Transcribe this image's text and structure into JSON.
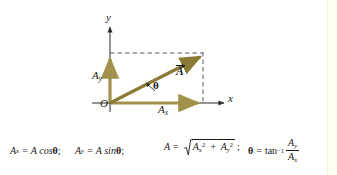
{
  "figure": {
    "axes": {
      "x_label": "x",
      "y_label": "y",
      "origin_label": "O"
    },
    "vectors": [
      {
        "name": "resultant",
        "label": "A",
        "label_style": "italic bold with arrow overbar",
        "color": "#8a7a35",
        "from": [
          110,
          103
        ],
        "to": [
          203,
          55
        ]
      },
      {
        "name": "x-component",
        "label": "A",
        "subscript": "x",
        "color": "#a1914a",
        "from": [
          110,
          103
        ],
        "to": [
          200,
          103
        ]
      },
      {
        "name": "y-component",
        "label": "A",
        "subscript": "y",
        "color": "#a1914a",
        "from": [
          110,
          103
        ],
        "to": [
          110,
          56
        ]
      }
    ],
    "angle": {
      "label": "θ",
      "symbol": "theta"
    },
    "labels": {
      "y_axis": "y",
      "x_axis": "x",
      "origin": "O",
      "Ay_base": "A",
      "Ay_sub": "y",
      "Ax_base": "A",
      "Ax_sub": "x",
      "A_vector": "A",
      "theta": "θ"
    },
    "dashed_lines": [
      {
        "name": "horizontal-projection",
        "from": [
          110,
          53
        ],
        "to": [
          203,
          53
        ]
      },
      {
        "name": "vertical-projection",
        "from": [
          203,
          53
        ],
        "to": [
          203,
          103
        ]
      }
    ],
    "colors": {
      "vector_dark": "#8a7a35",
      "vector_light": "#a1914a",
      "axis": "#2b2b2b",
      "dashed": "#3a4a6b",
      "background": "#fffffd",
      "right_strip": "#fffef2"
    }
  },
  "formulas": {
    "eq1": {
      "lhs_base": "A",
      "lhs_sub": "x",
      "equals": "=",
      "rhs": "A cos",
      "theta": "θ",
      "terminator": ";"
    },
    "eq2": {
      "lhs_base": "A",
      "lhs_sub": "y",
      "equals": "=",
      "rhs": "A sin",
      "theta": "θ",
      "terminator": ";"
    },
    "eq3": {
      "lhs": "A",
      "equals": "=",
      "radicand_1_base": "A",
      "radicand_1_sub": "x",
      "radicand_1_sup": "2",
      "plus": "+",
      "radicand_2_base": "A",
      "radicand_2_sub": "y",
      "radicand_2_sup": "2",
      "terminator": ";"
    },
    "eq4": {
      "lhs": "θ",
      "equals": "=",
      "fn": "tan",
      "fn_sup": "−1",
      "num_base": "A",
      "num_sub": "y",
      "den_base": "A",
      "den_sub": "x"
    }
  }
}
